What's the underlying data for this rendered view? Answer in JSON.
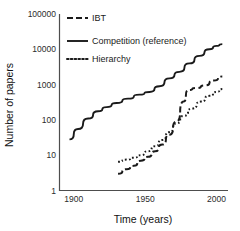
{
  "chart_data": {
    "type": "line",
    "title": "",
    "xlabel": "Time (years)",
    "ylabel": "Number of papers",
    "xlim": [
      1890,
      2008
    ],
    "ylim": [
      1,
      100000
    ],
    "yscale": "log",
    "grid": false,
    "legend_position": "top-left-inside",
    "xticks": [
      1900,
      1950,
      2000
    ],
    "xtick_labels": [
      "1900",
      "1950",
      "2000"
    ],
    "yticks": [
      1,
      10,
      100,
      1000,
      10000,
      100000
    ],
    "ytick_labels": [
      "1",
      "10",
      "100",
      "1000",
      "10000",
      "100000"
    ],
    "series": [
      {
        "name": "IBT",
        "style": "dashed",
        "x": [
          1931,
          1937,
          1942,
          1947,
          1952,
          1957,
          1962,
          1967,
          1972,
          1977,
          1980,
          1986,
          1992,
          1998,
          2004
        ],
        "y": [
          3,
          4,
          5,
          7,
          9,
          13,
          20,
          38,
          90,
          330,
          700,
          800,
          950,
          1300,
          1700
        ]
      },
      {
        "name": "Competition (reference)",
        "style": "solid",
        "x": [
          1897,
          1903,
          1910,
          1917,
          1923,
          1930,
          1938,
          1946,
          1953,
          1960,
          1967,
          1974,
          1981,
          1988,
          1995,
          2000,
          2004
        ],
        "y": [
          28,
          55,
          110,
          175,
          230,
          300,
          400,
          520,
          620,
          900,
          1500,
          2300,
          4000,
          6500,
          10000,
          12500,
          14000
        ]
      },
      {
        "name": "Hierarchy",
        "style": "dotted",
        "x": [
          1931,
          1937,
          1942,
          1947,
          1952,
          1957,
          1962,
          1967,
          1972,
          1977,
          1983,
          1989,
          1995,
          2000,
          2004
        ],
        "y": [
          6.5,
          7.5,
          8.5,
          10,
          13,
          18,
          27,
          45,
          80,
          130,
          210,
          330,
          480,
          620,
          750
        ]
      }
    ],
    "legend": [
      {
        "label": "IBT",
        "style": "dashed"
      },
      {
        "label": "Competition (reference)",
        "style": "solid"
      },
      {
        "label": "Hierarchy",
        "style": "dotted"
      }
    ],
    "colors": {
      "series": "#1a1a1a",
      "axis": "#4d4d4d",
      "text": "#1a1a1a",
      "background": "#ffffff"
    }
  }
}
